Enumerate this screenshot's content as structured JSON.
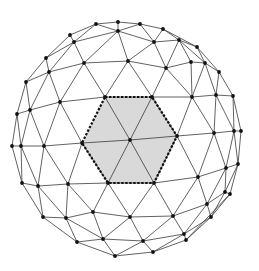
{
  "diagram": {
    "colors": {
      "background": "#ffffff",
      "edge": "#3a3a3a",
      "vertex": "#111111",
      "hex_fill": "#d9d9d9",
      "hex_outline": "#111111"
    },
    "hexagon": {
      "center": [
        130,
        140
      ],
      "corners": [
        [
          105,
          97
        ],
        [
          152,
          97
        ],
        [
          177,
          136
        ],
        [
          154,
          183
        ],
        [
          108,
          183
        ],
        [
          82,
          143
        ]
      ]
    },
    "vertices": {
      "a1": [
        96,
        24
      ],
      "a2": [
        118,
        22
      ],
      "a3": [
        140,
        24
      ],
      "a4": [
        163,
        29
      ],
      "b1": [
        70,
        35
      ],
      "b2": [
        74,
        42
      ],
      "b3": [
        118,
        31
      ],
      "b4": [
        154,
        42
      ],
      "b5": [
        179,
        40
      ],
      "b6": [
        197,
        47
      ],
      "c1": [
        46,
        58
      ],
      "c2": [
        49,
        72
      ],
      "c3": [
        84,
        63
      ],
      "c4": [
        128,
        61
      ],
      "c5": [
        166,
        68
      ],
      "c6": [
        191,
        62
      ],
      "c7": [
        205,
        63
      ],
      "c8": [
        219,
        72
      ],
      "d1": [
        26,
        82
      ],
      "d2": [
        30,
        110
      ],
      "d3": [
        60,
        102
      ],
      "d4": [
        192,
        97
      ],
      "d5": [
        216,
        95
      ],
      "d6": [
        233,
        96
      ],
      "e1": [
        17,
        114
      ],
      "e2": [
        214,
        133
      ],
      "e3": [
        234,
        131
      ],
      "e4": [
        241,
        131
      ],
      "f1": [
        12,
        146
      ],
      "f2": [
        21,
        146
      ],
      "f3": [
        44,
        146
      ],
      "g1": [
        22,
        183
      ],
      "g2": [
        38,
        186
      ],
      "g3": [
        68,
        184
      ],
      "g4": [
        198,
        177
      ],
      "g5": [
        226,
        168
      ],
      "g6": [
        238,
        164
      ],
      "h1": [
        43,
        217
      ],
      "h2": [
        66,
        218
      ],
      "h3": [
        93,
        212
      ],
      "h4": [
        130,
        217
      ],
      "h5": [
        173,
        216
      ],
      "h6": [
        207,
        204
      ],
      "h7": [
        225,
        192
      ],
      "h8": [
        230,
        194
      ],
      "i1": [
        77,
        242
      ],
      "i2": [
        103,
        239
      ],
      "i3": [
        143,
        241
      ],
      "i4": [
        184,
        234
      ],
      "i5": [
        186,
        240
      ],
      "i6": [
        211,
        217
      ],
      "j1": [
        115,
        256
      ],
      "j2": [
        153,
        252
      ],
      "H0": [
        105,
        97
      ],
      "H1": [
        152,
        97
      ],
      "H2": [
        177,
        136
      ],
      "H3": [
        154,
        183
      ],
      "H4": [
        108,
        183
      ],
      "H5": [
        82,
        143
      ],
      "HC": [
        130,
        140
      ]
    },
    "edges": [
      [
        "a1",
        "a2"
      ],
      [
        "a2",
        "a3"
      ],
      [
        "a3",
        "a4"
      ],
      [
        "a4",
        "b6"
      ],
      [
        "a1",
        "b1"
      ],
      [
        "b1",
        "c1"
      ],
      [
        "c1",
        "d1"
      ],
      [
        "d1",
        "e1"
      ],
      [
        "e1",
        "f1"
      ],
      [
        "a1",
        "b3"
      ],
      [
        "a2",
        "b3"
      ],
      [
        "a3",
        "b3"
      ],
      [
        "a3",
        "b4"
      ],
      [
        "a4",
        "b4"
      ],
      [
        "a4",
        "b5"
      ],
      [
        "b5",
        "b6"
      ],
      [
        "b6",
        "c8"
      ],
      [
        "b1",
        "b2"
      ],
      [
        "a1",
        "b2"
      ],
      [
        "b2",
        "b3"
      ],
      [
        "b3",
        "b4"
      ],
      [
        "b4",
        "b5"
      ],
      [
        "b5",
        "c6"
      ],
      [
        "b5",
        "c7"
      ],
      [
        "b6",
        "c7"
      ],
      [
        "c7",
        "c8"
      ],
      [
        "b2",
        "c1"
      ],
      [
        "b2",
        "c2"
      ],
      [
        "b2",
        "c3"
      ],
      [
        "b3",
        "c3"
      ],
      [
        "b3",
        "c4"
      ],
      [
        "b4",
        "c4"
      ],
      [
        "b4",
        "c5"
      ],
      [
        "b5",
        "c5"
      ],
      [
        "c5",
        "c6"
      ],
      [
        "c6",
        "c7"
      ],
      [
        "c1",
        "c2"
      ],
      [
        "c1",
        "d1"
      ],
      [
        "c2",
        "c3"
      ],
      [
        "c3",
        "c4"
      ],
      [
        "c4",
        "c5"
      ],
      [
        "c2",
        "d1"
      ],
      [
        "c2",
        "d2"
      ],
      [
        "c2",
        "d3"
      ],
      [
        "c3",
        "d3"
      ],
      [
        "c3",
        "H0"
      ],
      [
        "c4",
        "H0"
      ],
      [
        "c4",
        "H1"
      ],
      [
        "c5",
        "H1"
      ],
      [
        "c5",
        "d4"
      ],
      [
        "c6",
        "d4"
      ],
      [
        "c7",
        "d4"
      ],
      [
        "c7",
        "d5"
      ],
      [
        "c8",
        "d5"
      ],
      [
        "c8",
        "d6"
      ],
      [
        "d1",
        "d2"
      ],
      [
        "d2",
        "d3"
      ],
      [
        "d3",
        "H0"
      ],
      [
        "H0",
        "H1"
      ],
      [
        "H1",
        "d4"
      ],
      [
        "d4",
        "d5"
      ],
      [
        "d5",
        "d6"
      ],
      [
        "d1",
        "e1"
      ],
      [
        "d2",
        "e1"
      ],
      [
        "d2",
        "f2"
      ],
      [
        "d2",
        "f3"
      ],
      [
        "d3",
        "f3"
      ],
      [
        "d3",
        "H5"
      ],
      [
        "H1",
        "H2"
      ],
      [
        "d4",
        "H2"
      ],
      [
        "d4",
        "e2"
      ],
      [
        "d5",
        "e2"
      ],
      [
        "d5",
        "e3"
      ],
      [
        "d6",
        "e3"
      ],
      [
        "d6",
        "e4"
      ],
      [
        "e1",
        "f1"
      ],
      [
        "e1",
        "f2"
      ],
      [
        "f1",
        "f2"
      ],
      [
        "f2",
        "f3"
      ],
      [
        "f3",
        "H5"
      ],
      [
        "H2",
        "e2"
      ],
      [
        "e2",
        "e3"
      ],
      [
        "e3",
        "e4"
      ],
      [
        "f1",
        "g1"
      ],
      [
        "f2",
        "g1"
      ],
      [
        "f2",
        "g2"
      ],
      [
        "f3",
        "g2"
      ],
      [
        "f3",
        "g3"
      ],
      [
        "H5",
        "g3"
      ],
      [
        "H5",
        "H4"
      ],
      [
        "H2",
        "H3"
      ],
      [
        "H2",
        "g4"
      ],
      [
        "e2",
        "g4"
      ],
      [
        "e2",
        "g5"
      ],
      [
        "e3",
        "g5"
      ],
      [
        "e3",
        "g6"
      ],
      [
        "e4",
        "g6"
      ],
      [
        "g1",
        "g2"
      ],
      [
        "g2",
        "g3"
      ],
      [
        "g3",
        "H4"
      ],
      [
        "H4",
        "H3"
      ],
      [
        "H3",
        "g4"
      ],
      [
        "g4",
        "g5"
      ],
      [
        "g5",
        "g6"
      ],
      [
        "g1",
        "h1"
      ],
      [
        "g2",
        "h1"
      ],
      [
        "g2",
        "h2"
      ],
      [
        "g3",
        "h2"
      ],
      [
        "g3",
        "h3"
      ],
      [
        "H4",
        "h3"
      ],
      [
        "H4",
        "h4"
      ],
      [
        "H3",
        "h4"
      ],
      [
        "H3",
        "h5"
      ],
      [
        "g4",
        "h5"
      ],
      [
        "g4",
        "h6"
      ],
      [
        "g5",
        "h6"
      ],
      [
        "g5",
        "h7"
      ],
      [
        "g6",
        "h7"
      ],
      [
        "g6",
        "h8"
      ],
      [
        "h7",
        "h8"
      ],
      [
        "h1",
        "h2"
      ],
      [
        "h2",
        "h3"
      ],
      [
        "h3",
        "h4"
      ],
      [
        "h4",
        "h5"
      ],
      [
        "h5",
        "h6"
      ],
      [
        "h6",
        "h7"
      ],
      [
        "h1",
        "i1"
      ],
      [
        "h2",
        "i1"
      ],
      [
        "h2",
        "i2"
      ],
      [
        "h3",
        "i2"
      ],
      [
        "h4",
        "i2"
      ],
      [
        "h4",
        "i3"
      ],
      [
        "h5",
        "i3"
      ],
      [
        "h5",
        "i4"
      ],
      [
        "h6",
        "i4"
      ],
      [
        "h6",
        "i6"
      ],
      [
        "h7",
        "i6"
      ],
      [
        "h8",
        "i6"
      ],
      [
        "h8",
        "i5"
      ],
      [
        "i1",
        "i2"
      ],
      [
        "i2",
        "i3"
      ],
      [
        "i3",
        "i4"
      ],
      [
        "i4",
        "i6"
      ],
      [
        "i4",
        "i5"
      ],
      [
        "i5",
        "i6"
      ],
      [
        "i1",
        "j1"
      ],
      [
        "i2",
        "j1"
      ],
      [
        "i3",
        "j1"
      ],
      [
        "i3",
        "j2"
      ],
      [
        "i4",
        "j2"
      ],
      [
        "i5",
        "j2"
      ],
      [
        "j1",
        "j2"
      ],
      [
        "HC",
        "H0"
      ],
      [
        "HC",
        "H1"
      ],
      [
        "HC",
        "H2"
      ],
      [
        "HC",
        "H3"
      ],
      [
        "HC",
        "H4"
      ],
      [
        "HC",
        "H5"
      ],
      [
        "H5",
        "f3"
      ],
      [
        "H5",
        "d3"
      ]
    ]
  }
}
